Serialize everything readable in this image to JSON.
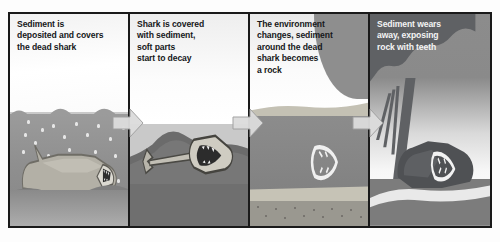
{
  "figure": {
    "panel_count": 4,
    "flow_direction": "left-to-right",
    "arrow_count": 3,
    "arrow_icon": "right-arrow-icon",
    "colors": {
      "frame": "#1a1a1a",
      "arrow_fill": "#dcdcdc",
      "arrow_stroke": "#8c8c8c",
      "caption_dark": "#16181a",
      "caption_light": "#f4f4f4",
      "water": "#8f8f8f",
      "sediment": "#8a8a8a",
      "rock": "#838383",
      "silhouette": "#5f6164"
    }
  },
  "panels": [
    {
      "index": 1,
      "caption": "Sediment is\ndeposited and covers\nthe dead shark",
      "caption_style": "dark",
      "scene_name": "dead-shark-on-seabed-with-falling-sediment",
      "elements": [
        "water-surface",
        "falling-sediment-particles",
        "dead-shark",
        "seabed"
      ]
    },
    {
      "index": 2,
      "caption": "Shark is covered\nwith sediment,\nsoft parts\nstart to decay",
      "caption_style": "dark",
      "scene_name": "shark-skeleton-buried-in-sediment",
      "elements": [
        "sediment-mound",
        "shark-skeleton",
        "shark-jaw",
        "lower-sediment-layer"
      ]
    },
    {
      "index": 3,
      "caption": "The environment\nchanges, sediment\naround the dead\nshark becomes\na rock",
      "caption_style": "dark",
      "scene_name": "fossil-jaw-within-rock-strata",
      "elements": [
        "distant-hill",
        "upper-rock-band",
        "rock-body",
        "fossil-jaw",
        "lower-rock-band",
        "gritty-base"
      ]
    },
    {
      "index": 4,
      "caption": "Sediment wears\naway, exposing\nrock with teeth",
      "caption_style": "light",
      "scene_name": "eroded-rock-exposing-fossil-teeth",
      "elements": [
        "tree-silhouette",
        "tree-trunk",
        "exposed-boulder",
        "fossil-teeth",
        "ground"
      ]
    }
  ]
}
